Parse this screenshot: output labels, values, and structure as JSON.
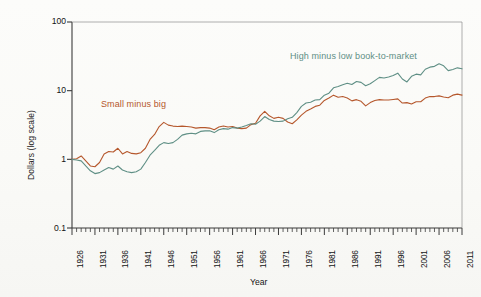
{
  "chart_data": {
    "type": "line",
    "title": "",
    "xlabel": "Year",
    "ylabel": "Dollars (log scale)",
    "yscale": "log",
    "ylim": [
      0.1,
      100
    ],
    "xlim": [
      1926,
      2011
    ],
    "grid": false,
    "legend_position": "inline-annotations",
    "ytick_labels": [
      "100",
      "10",
      "1",
      "0.1"
    ],
    "ytick_values": [
      100,
      10,
      1,
      0.1
    ],
    "xtick_labels": [
      "1926",
      "1931",
      "1936",
      "1941",
      "1946",
      "1951",
      "1956",
      "1961",
      "1966",
      "1971",
      "1976",
      "1981",
      "1986",
      "1991",
      "1996",
      "2001",
      "2006",
      "2011"
    ],
    "xtick_values": [
      1926,
      1931,
      1936,
      1941,
      1946,
      1951,
      1956,
      1961,
      1966,
      1971,
      1976,
      1981,
      1986,
      1991,
      1996,
      2001,
      2006,
      2011
    ],
    "minor_tick_interval": 1,
    "series": [
      {
        "name": "Small minus big",
        "color": "#b5572c",
        "label_x": 1936,
        "label_y": 4.4,
        "x": [
          1926,
          1927,
          1928,
          1929,
          1930,
          1931,
          1932,
          1933,
          1934,
          1935,
          1936,
          1937,
          1938,
          1939,
          1940,
          1941,
          1942,
          1943,
          1944,
          1945,
          1946,
          1947,
          1948,
          1949,
          1950,
          1951,
          1952,
          1953,
          1954,
          1955,
          1956,
          1957,
          1958,
          1959,
          1960,
          1961,
          1962,
          1963,
          1964,
          1965,
          1966,
          1967,
          1968,
          1969,
          1970,
          1971,
          1972,
          1973,
          1974,
          1975,
          1976,
          1977,
          1978,
          1979,
          1980,
          1981,
          1982,
          1983,
          1984,
          1985,
          1986,
          1987,
          1988,
          1989,
          1990,
          1991,
          1992,
          1993,
          1994,
          1995,
          1996,
          1997,
          1998,
          1999,
          2000,
          2001,
          2002,
          2003,
          2004,
          2005,
          2006,
          2007,
          2008,
          2009,
          2010,
          2011
        ],
        "values": [
          1.0,
          1.02,
          1.12,
          0.95,
          0.8,
          0.78,
          0.9,
          1.2,
          1.3,
          1.28,
          1.45,
          1.2,
          1.3,
          1.22,
          1.2,
          1.25,
          1.45,
          1.95,
          2.3,
          3.0,
          3.45,
          3.15,
          3.05,
          3.0,
          3.05,
          3.0,
          2.95,
          2.85,
          2.9,
          2.9,
          2.85,
          2.7,
          2.95,
          3.05,
          2.95,
          3.0,
          2.85,
          2.8,
          2.85,
          3.2,
          3.35,
          4.3,
          5.0,
          4.3,
          3.95,
          4.1,
          3.95,
          3.5,
          3.3,
          3.75,
          4.4,
          5.0,
          5.4,
          5.9,
          6.15,
          7.2,
          7.8,
          8.6,
          8.0,
          8.2,
          7.8,
          7.1,
          7.4,
          7.0,
          6.0,
          6.7,
          7.2,
          7.4,
          7.3,
          7.3,
          7.45,
          7.6,
          6.6,
          6.7,
          6.4,
          6.9,
          6.9,
          7.8,
          8.2,
          8.2,
          8.4,
          8.1,
          7.9,
          8.6,
          8.9,
          8.6
        ]
      },
      {
        "name": "High minus low book-to-market",
        "color": "#5f8f85",
        "label_x": 1972,
        "label_y": 33,
        "x": [
          1926,
          1927,
          1928,
          1929,
          1930,
          1931,
          1932,
          1933,
          1934,
          1935,
          1936,
          1937,
          1938,
          1939,
          1940,
          1941,
          1942,
          1943,
          1944,
          1945,
          1946,
          1947,
          1948,
          1949,
          1950,
          1951,
          1952,
          1953,
          1954,
          1955,
          1956,
          1957,
          1958,
          1959,
          1960,
          1961,
          1962,
          1963,
          1964,
          1965,
          1966,
          1967,
          1968,
          1969,
          1970,
          1971,
          1972,
          1973,
          1974,
          1975,
          1976,
          1977,
          1978,
          1979,
          1980,
          1981,
          1982,
          1983,
          1984,
          1985,
          1986,
          1987,
          1988,
          1989,
          1990,
          1991,
          1992,
          1993,
          1994,
          1995,
          1996,
          1997,
          1998,
          1999,
          2000,
          2001,
          2002,
          2003,
          2004,
          2005,
          2006,
          2007,
          2008,
          2009,
          2010,
          2011
        ],
        "values": [
          1.0,
          0.98,
          0.95,
          0.8,
          0.68,
          0.62,
          0.64,
          0.7,
          0.76,
          0.72,
          0.8,
          0.7,
          0.66,
          0.64,
          0.66,
          0.72,
          0.9,
          1.15,
          1.35,
          1.6,
          1.75,
          1.7,
          1.75,
          1.95,
          2.25,
          2.35,
          2.4,
          2.35,
          2.55,
          2.6,
          2.6,
          2.45,
          2.7,
          2.8,
          2.75,
          2.9,
          2.85,
          2.95,
          3.1,
          3.3,
          3.25,
          3.6,
          4.2,
          3.8,
          3.6,
          3.55,
          3.6,
          3.9,
          4.1,
          4.8,
          5.9,
          6.6,
          6.8,
          7.3,
          7.4,
          8.6,
          9.2,
          11.0,
          11.5,
          12.2,
          12.8,
          12.3,
          13.6,
          13.2,
          11.8,
          12.6,
          14.0,
          15.6,
          15.3,
          15.8,
          16.6,
          18.0,
          14.8,
          13.4,
          16.2,
          17.4,
          17.0,
          20.5,
          22.0,
          22.6,
          24.6,
          23.0,
          19.6,
          20.4,
          21.5,
          20.8
        ]
      }
    ]
  },
  "axes": {
    "y_axis_title": "Dollars (log scale)",
    "x_axis_title": "Year"
  }
}
